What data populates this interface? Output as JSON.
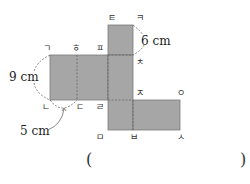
{
  "diagram": {
    "type": "net of rectangular prism",
    "fill_color": "#a6a6a6",
    "edge_color": "#7a7a7a",
    "vertex_labels": {
      "v1": "ㄱ",
      "v2": "ㄴ",
      "v3": "ㄷ",
      "v4": "ㄹ",
      "v5": "ㅁ",
      "v6": "ㅂ",
      "v7": "ㅅ",
      "v8": "ㅇ",
      "v9": "ㅈ",
      "v10": "ㅊ",
      "v11": "ㅋ",
      "v12": "ㅌ",
      "v13": "ㅍ",
      "v14": "ㅎ"
    },
    "measurements": {
      "left_height": "9 cm",
      "top_side": "6 cm",
      "bottom_width": "5 cm"
    }
  },
  "answer_box": {
    "open": "(",
    "close": ")"
  }
}
